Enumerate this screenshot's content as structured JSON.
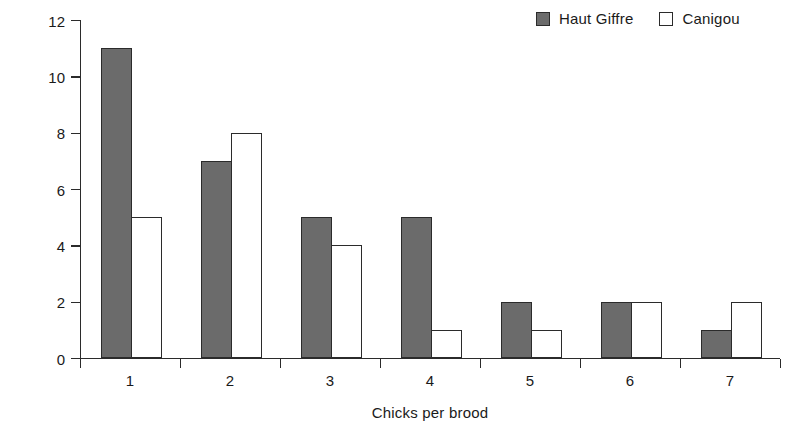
{
  "chart_data": {
    "type": "bar",
    "title": "",
    "xlabel": "Chicks per brood",
    "ylabel": "Number of broods",
    "categories": [
      "1",
      "2",
      "3",
      "4",
      "5",
      "6",
      "7"
    ],
    "series": [
      {
        "name": "Haut Giffre",
        "values": [
          11,
          7,
          5,
          5,
          2,
          2,
          1
        ],
        "color": "#6b6b6b",
        "style": "filled"
      },
      {
        "name": "Canigou",
        "values": [
          5,
          8,
          4,
          1,
          1,
          2,
          2
        ],
        "color": "#ffffff",
        "style": "hollow"
      }
    ],
    "ylim": [
      0,
      12
    ],
    "yticks": [
      0,
      2,
      4,
      6,
      8,
      10,
      12
    ],
    "grid": false,
    "legend_position": "top-right"
  },
  "legend": {
    "entries": [
      {
        "label": "Haut Giffre",
        "swatch": "filled-square-icon"
      },
      {
        "label": "Canigou",
        "swatch": "hollow-square-icon"
      }
    ]
  },
  "axes": {
    "y_title": "Number of broods",
    "x_title": "Chicks per brood",
    "y_tick_labels": [
      "0",
      "2",
      "4",
      "6",
      "8",
      "10",
      "12"
    ],
    "x_tick_labels": [
      "1",
      "2",
      "3",
      "4",
      "5",
      "6",
      "7"
    ]
  }
}
